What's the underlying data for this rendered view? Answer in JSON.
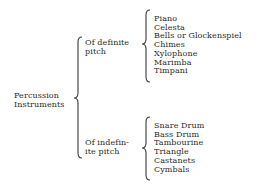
{
  "diagram": {
    "type": "tree-brace-classification",
    "root": {
      "label_line1": "Percussion",
      "label_line2": "Instruments"
    },
    "categories": [
      {
        "label_line1": "Of definite",
        "label_line2": "pitch",
        "items": [
          "Piano",
          "Celesta",
          "Bells or Glockenspiel",
          "Chimes",
          "Xylophone",
          "Marimba",
          "Timpani"
        ]
      },
      {
        "label_line1": "Of indefin-",
        "label_line2": "ite pitch",
        "items": [
          "Snare Drum",
          "Bass Drum",
          "Tambourine",
          "Triangle",
          "Castanets",
          "Cymbals"
        ]
      }
    ],
    "colors": {
      "text": "#2a2a2a",
      "brace": "#3a3a3a",
      "background": "#ffffff"
    }
  }
}
